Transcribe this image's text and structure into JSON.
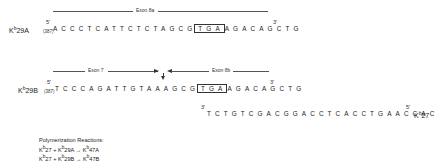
{
  "row1": {
    "label_prefix": "K",
    "label_sup": "b",
    "label_suffix": "29A",
    "five_prime": "5'",
    "position": "(387)",
    "sequence": "ACCCTCATTCTCTAGCGTGAAGACAGCTG",
    "seq_before_box": "ACCCTCATTCTCTAGCG",
    "boxed": "TGA",
    "seq_after_box": "AGACAGCTG",
    "three_prime": "3'",
    "exon_label": "Exon 8a"
  },
  "row2": {
    "label_prefix": "K",
    "label_sup": "b",
    "label_suffix": "29B",
    "five_prime": "5'",
    "position": "(387)",
    "sequence": "TCCCAGATTGTAAAGCGTGAAGACAGCTG",
    "seq_before_box": "TCCCAGATTGTAAAGCG",
    "boxed": "TGA",
    "seq_after_box": "AGACAGCTG",
    "three_prime": "3'",
    "exon_left_label": "Exon 7",
    "exon_right_label": "Exon 8b",
    "junction_marker": "splice-junction-arrow"
  },
  "row3": {
    "three_prime": "3'",
    "sequence": "TCTGTCGACGGACCTCACCTGAACCAC",
    "five_prime": "5'",
    "label_prefix": "K",
    "label_sup": "b",
    "label_suffix": "27"
  },
  "reactions": {
    "title": "Polymerization Reactions:",
    "items": [
      {
        "a_sup": "b",
        "a": "27",
        "op": "+",
        "b_sup": "b",
        "b": "29A",
        "arrow": "→",
        "c_sup": "b",
        "c": "47A"
      },
      {
        "a_sup": "b",
        "a": "27",
        "op": "+",
        "b_sup": "b",
        "b": "29B",
        "arrow": "→",
        "c_sup": "b",
        "c": "47B"
      }
    ]
  }
}
